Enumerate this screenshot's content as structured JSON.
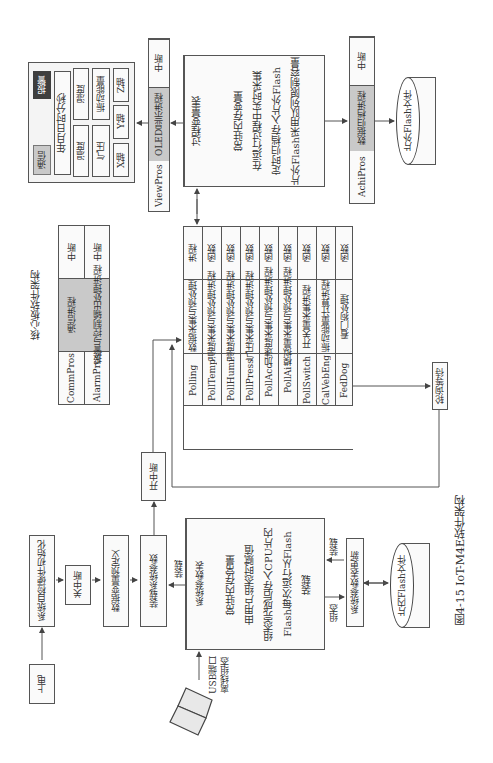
{
  "core_title": "核心板软件架构",
  "display_panel": {
    "comm_btn": "通信",
    "alarm_btn": "报警",
    "datetime": "年月日时分秒",
    "temp": "温度",
    "humi": "湿度",
    "pressure": "气压",
    "vib_energy": "振动能量",
    "x_axis": "X轴",
    "y_axis": "Y轴",
    "z_axis": "Z轴"
  },
  "view_proc": {
    "name": "ViewPros",
    "desc": "OLED显示进程",
    "type": "中断"
  },
  "process_var_table": {
    "header": "过程变量表",
    "lines": [
      "常驻内存变量",
      "在运行过程中实时采集",
      "定时归档存入片外Flash",
      "片外Flash采用队列限制容量"
    ]
  },
  "achi_proc": {
    "name": "AchiPros",
    "desc": "数据归档进程",
    "type": "中断"
  },
  "ext_flash": "片外Flash文件",
  "comm_table": [
    {
      "name": "CommPros",
      "desc": "通信进程",
      "type": "中断"
    },
    {
      "name": "AlarmPros",
      "desc": "报警与控制输出处理进程",
      "type": "中断"
    }
  ],
  "polling_table": [
    {
      "name": "Polling",
      "desc": "数据采集与预处理",
      "type": "进程"
    },
    {
      "name": "PollTemp",
      "desc": "温度采集与预处理进程",
      "type": "函数"
    },
    {
      "name": "PollHumi",
      "desc": "湿度采集与预处理进程",
      "type": "函数"
    },
    {
      "name": "PollPress",
      "desc": "气压采集与预处理进程",
      "type": "函数"
    },
    {
      "name": "PollAcc",
      "desc": "加速度采集与预处理进程",
      "type": "函数"
    },
    {
      "name": "PollAi",
      "desc": "模拟量采集与预处理进程",
      "type": "函数"
    },
    {
      "name": "PollSwitch",
      "desc": "开关量采集进程",
      "type": "函数"
    },
    {
      "name": "CalVebEng",
      "desc": "振动能量计算进程",
      "type": "函数"
    },
    {
      "name": "FedDog",
      "desc": "看门狗处理",
      "type": "函数"
    }
  ],
  "poll_wait": "轮询等待",
  "flow": {
    "power_on": "上电",
    "self_check": "系统自检硬件初始化",
    "disable_int": "关中断",
    "var_predef": "数据变量预定义",
    "load_params": "装载系统参数",
    "enable_int": "开中断"
  },
  "sys_param_table": {
    "header": "系统参数表",
    "lines": [
      "常驻内存常量",
      "由用户组态时赋值",
      "组态完成后存入CPU片内",
      "Flash每次运行从Flash",
      "装载"
    ]
  },
  "labels": {
    "load1": "装载",
    "load2": "装载",
    "config": "组态",
    "usb": "USB端口",
    "offline": "离线组态"
  },
  "sys_param_update": "系统参数表更新",
  "int_flash": "片内Flash文件",
  "caption": "图4-15   IoT-M4E软件架构",
  "colors": {
    "line": "#555555",
    "gray_fill": "#c9c9c9",
    "dark_fill": "#3e3e3e"
  }
}
